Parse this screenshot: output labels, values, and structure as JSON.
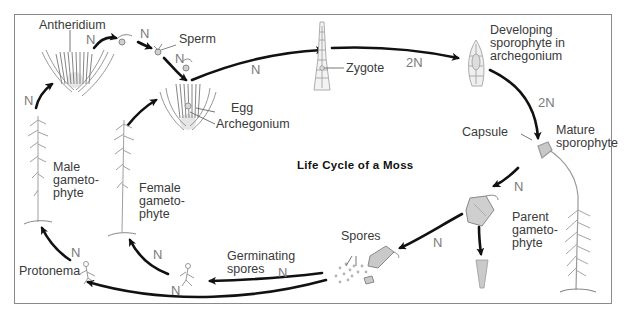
{
  "title": "Life Cycle of a Moss",
  "labels": {
    "antheridium": "Antheridium",
    "sperm": "Sperm",
    "egg": "Egg",
    "archegonium": "Archegonium",
    "zygote": "Zygote",
    "developing_sporophyte": [
      "Developing",
      "sporophyte in",
      "archegonium"
    ],
    "capsule": "Capsule",
    "mature_sporophyte": [
      "Mature",
      "sporophyte"
    ],
    "parent_gametophyte": [
      "Parent",
      "gameto-",
      "phyte"
    ],
    "spores": "Spores",
    "germinating_spores": [
      "Germinating",
      "spores"
    ],
    "protonema": "Protonema",
    "male_gametophyte": [
      "Male",
      "gameto-",
      "phyte"
    ],
    "female_gametophyte": [
      "Female",
      "gameto-",
      "phyte"
    ]
  },
  "ploidy": {
    "antheridium_to_sperm": "N",
    "sperm_release": "N",
    "sperm_to_egg": "N",
    "male_to_antheridium": "N",
    "archegonium_to_zygote": "N",
    "zygote_to_developing": "2N",
    "developing_to_mature": "2N",
    "capsule_to_open": "N",
    "capsule_to_spores": "N",
    "spores_to_germinating": "N",
    "germinating_to_female": "N",
    "germinating_lower": "N",
    "protonema_to_male": "N"
  },
  "colors": {
    "arrow": "#111111",
    "frame": "#8a8a8a",
    "plant": "#9a9a9a",
    "label": "#3a3a3a",
    "ploidy": "#7a7a7a"
  }
}
